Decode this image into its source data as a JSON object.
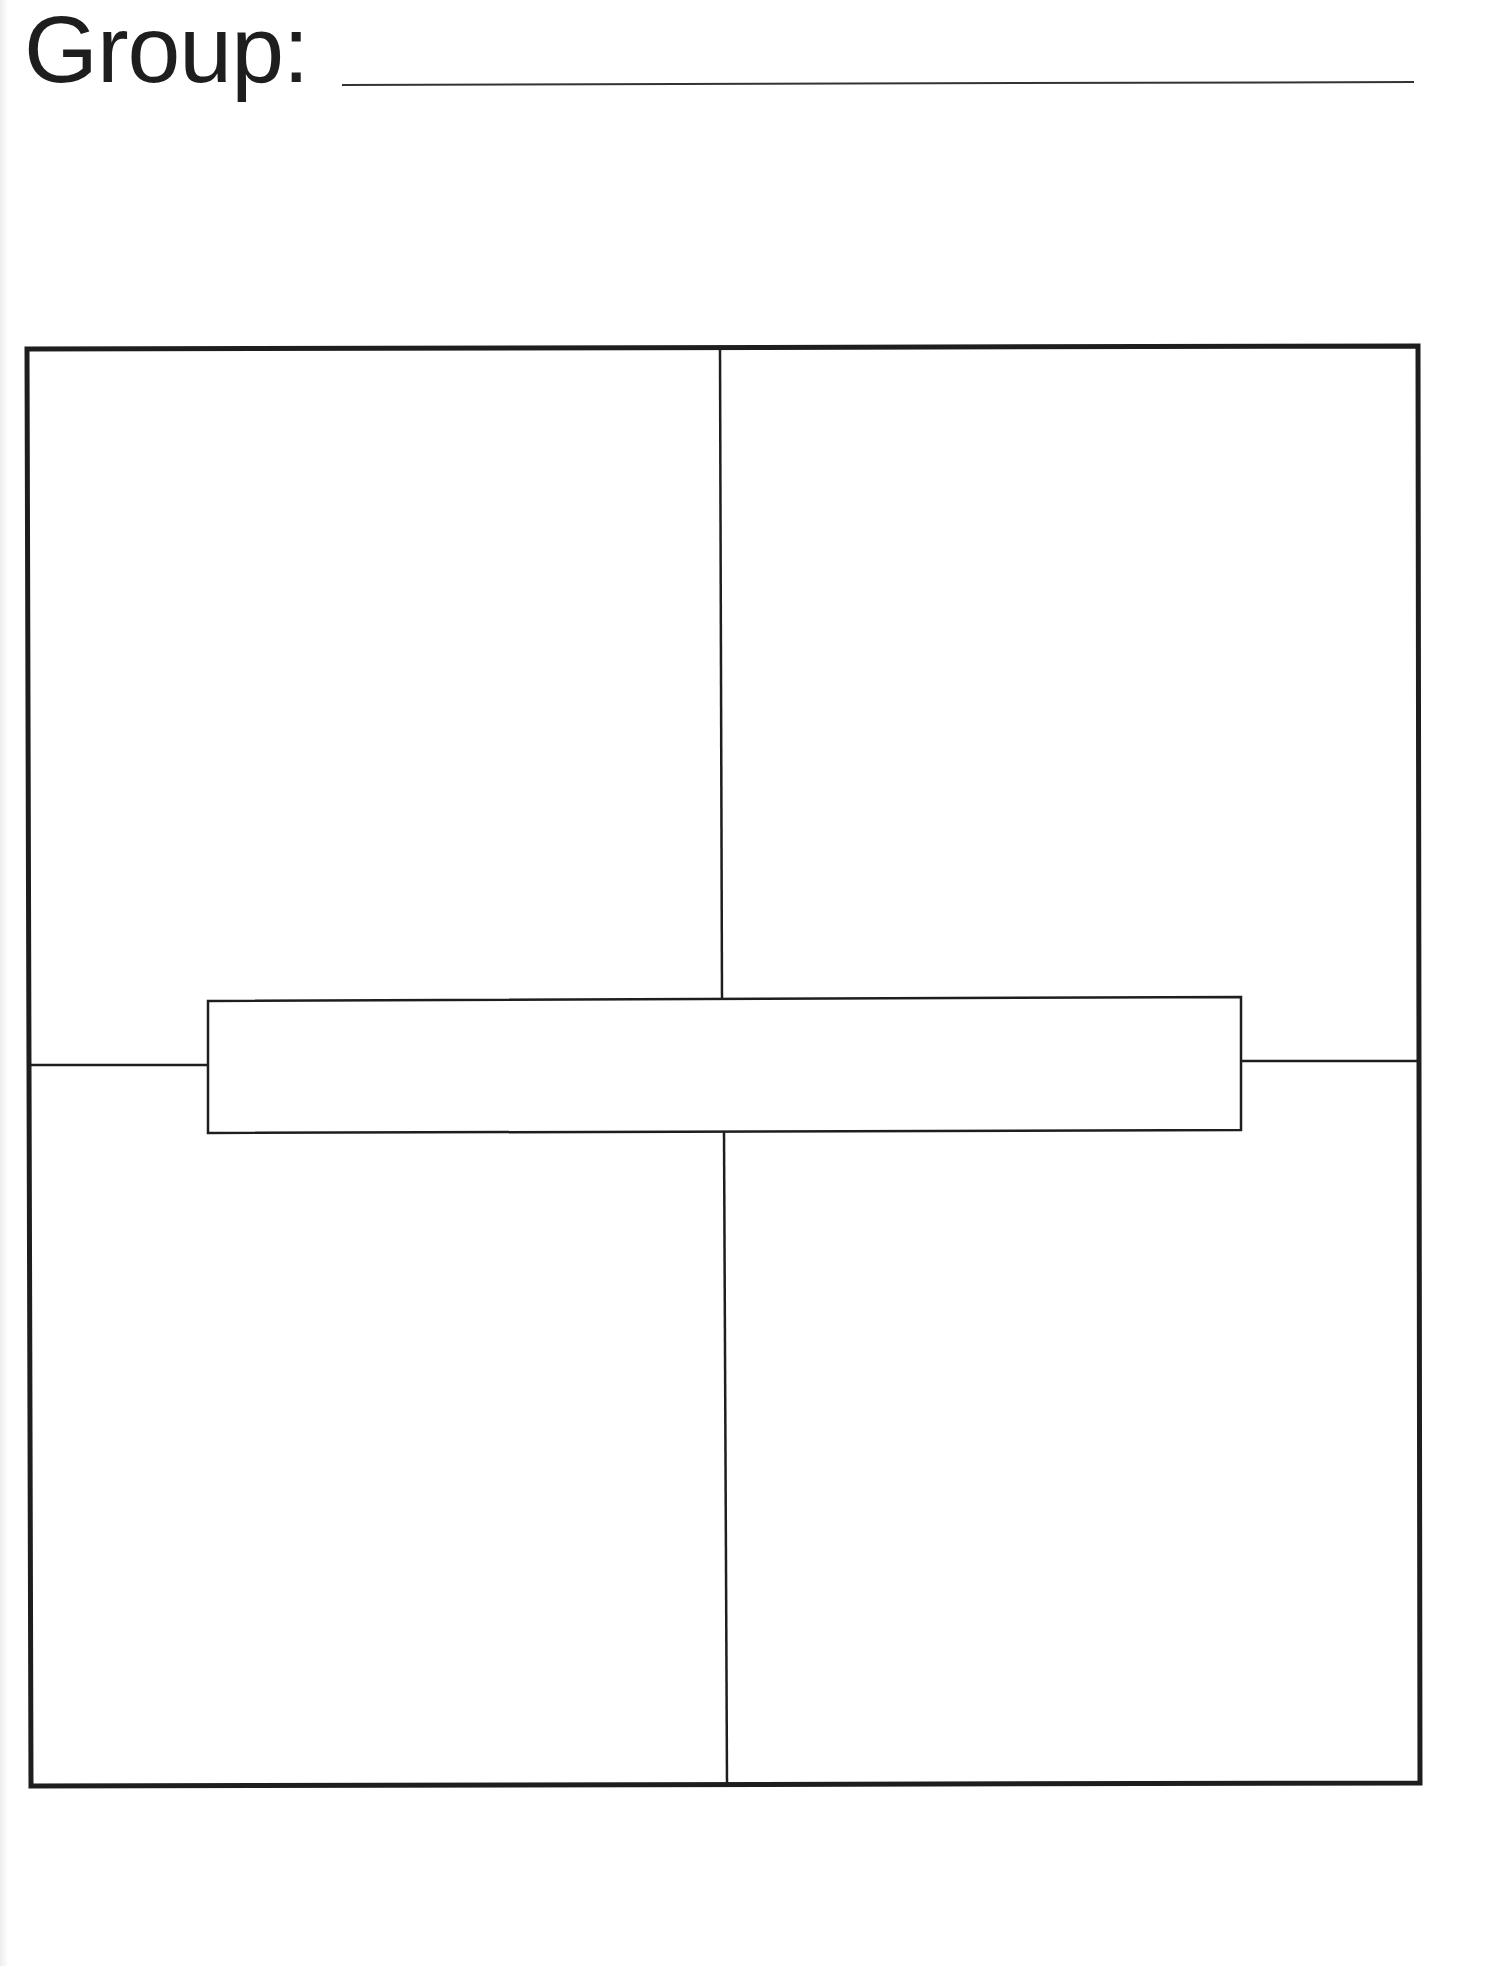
{
  "worksheet": {
    "group_label": "Group:",
    "group_value": "",
    "organizer": {
      "type": "four-square",
      "quadrants": [
        {
          "position": "top-left",
          "content": ""
        },
        {
          "position": "top-right",
          "content": ""
        },
        {
          "position": "bottom-left",
          "content": ""
        },
        {
          "position": "bottom-right",
          "content": ""
        }
      ],
      "center_box": {
        "content": ""
      }
    },
    "colors": {
      "ink": "#1e1e1e",
      "paper": "#ffffff"
    }
  }
}
